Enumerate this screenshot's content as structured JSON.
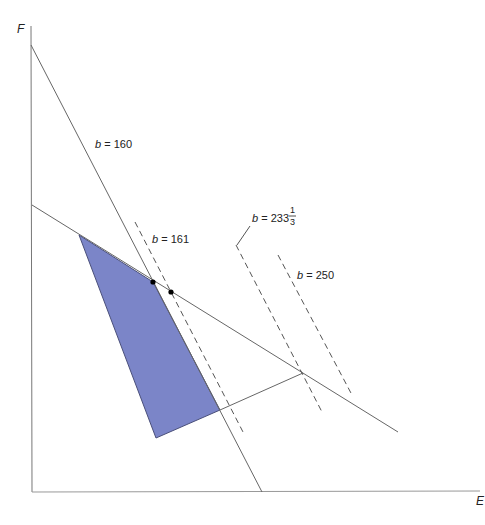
{
  "axes": {
    "y_label": "F",
    "x_label": "E"
  },
  "lines": {
    "budget_160": {
      "var": "b",
      "eq": " = 160"
    },
    "budget_161": {
      "var": "b",
      "eq": " = 161"
    },
    "budget_233": {
      "var": "b",
      "eq": " = 233",
      "frac_num": "1",
      "frac_den": "3"
    },
    "budget_250": {
      "var": "b",
      "eq": " = 250"
    }
  },
  "colors": {
    "feasible_region": "#7b85c8",
    "feasible_border": "#4a4f7a",
    "line": "#666666",
    "dashed": "#555555",
    "point": "#000000"
  }
}
